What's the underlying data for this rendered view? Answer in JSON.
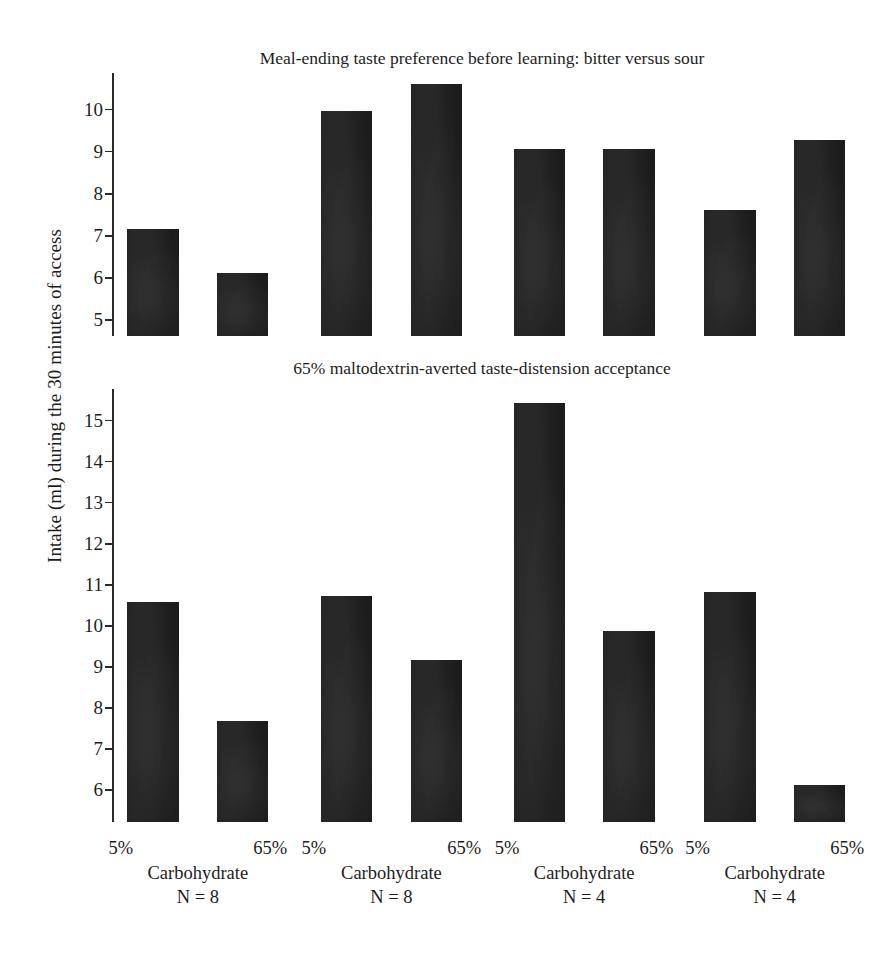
{
  "figure": {
    "ylabel": "Intake (ml) during the 30 minutes of access"
  },
  "panels": [
    {
      "title": "Meal-ending taste preference before learning: bitter versus sour",
      "ticks": [
        "10",
        "9",
        "8",
        "7",
        "6",
        "5"
      ]
    },
    {
      "title": "65% maltodextrin-averted taste-distension acceptance",
      "ticks": [
        "15",
        "14",
        "13",
        "12",
        "11",
        "10",
        "9",
        "8",
        "7",
        "6"
      ]
    }
  ],
  "xaxis": {
    "groups": [
      {
        "low": "5%",
        "high": "65%",
        "category": "Carbohydrate",
        "n": "N = 8"
      },
      {
        "low": "5%",
        "high": "65%",
        "category": "Carbohydrate",
        "n": "N = 8"
      },
      {
        "low": "5%",
        "high": "65%",
        "category": "Carbohydrate",
        "n": "N = 4"
      },
      {
        "low": "5%",
        "high": "65%",
        "category": "Carbohydrate",
        "n": "N = 4"
      }
    ]
  },
  "chart_data": [
    {
      "type": "bar",
      "title": "Meal-ending taste preference before learning: bitter versus sour",
      "xlabel": "Carbohydrate",
      "ylabel": "Intake (ml) during the 30 minutes of access",
      "ylim": [
        4.6,
        10.85
      ],
      "yticks": [
        5,
        6,
        7,
        8,
        9,
        10
      ],
      "grid": false,
      "legend": null,
      "categories": [
        "5%",
        "65%",
        "5%",
        "65%",
        "5%",
        "65%",
        "5%",
        "65%"
      ],
      "groups": [
        "Carbohydrate N = 8",
        "Carbohydrate N = 8",
        "Carbohydrate N = 4",
        "Carbohydrate N = 4"
      ],
      "values": [
        7.15,
        6.1,
        9.95,
        10.6,
        9.05,
        9.05,
        7.6,
        9.25
      ]
    },
    {
      "type": "bar",
      "title": "65% maltodextrin-averted taste-distension acceptance",
      "xlabel": "Carbohydrate",
      "ylabel": "Intake (ml) during the 30 minutes of access",
      "ylim": [
        5.2,
        15.75
      ],
      "yticks": [
        6,
        7,
        8,
        9,
        10,
        11,
        12,
        13,
        14,
        15
      ],
      "grid": false,
      "legend": null,
      "categories": [
        "5%",
        "65%",
        "5%",
        "65%",
        "5%",
        "65%",
        "5%",
        "65%"
      ],
      "groups": [
        "Carbohydrate N = 8",
        "Carbohydrate N = 8",
        "Carbohydrate N = 4",
        "Carbohydrate N = 4"
      ],
      "values": [
        10.55,
        7.65,
        10.7,
        9.15,
        15.4,
        9.85,
        10.8,
        6.1
      ]
    }
  ]
}
